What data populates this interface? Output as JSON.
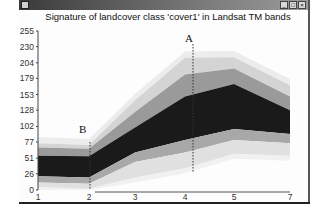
{
  "window": {
    "title_bar_buttons": [
      "minimize",
      "maximize",
      "close"
    ]
  },
  "chart_data": {
    "type": "area",
    "title": "Signature of landcover class 'cover1' in Landsat TM bands",
    "xlabel": "",
    "ylabel": "",
    "x": [
      1,
      2,
      3,
      4,
      5,
      7
    ],
    "x_tick_labels": [
      "1",
      "2",
      "3",
      "4",
      "5",
      "7"
    ],
    "y_tick_labels": [
      "0",
      "26",
      "51",
      "77",
      "102",
      "128",
      "153",
      "179",
      "204",
      "230",
      "255"
    ],
    "ylim": [
      0,
      255
    ],
    "grid": false,
    "legend": null,
    "series": [
      {
        "name": "outer upper (lightest)",
        "values": [
          75,
          72,
          144,
          212,
          213,
          168
        ]
      },
      {
        "name": "upper (light gray)",
        "values": [
          68,
          66,
          125,
          185,
          195,
          150
        ]
      },
      {
        "name": "core upper (black)",
        "values": [
          55,
          54,
          100,
          150,
          170,
          128
        ]
      },
      {
        "name": "core lower (black)",
        "values": [
          22,
          20,
          60,
          80,
          98,
          90
        ]
      },
      {
        "name": "lower (light gray)",
        "values": [
          12,
          10,
          45,
          60,
          80,
          75
        ]
      },
      {
        "name": "outer lower (lightest)",
        "values": [
          5,
          2,
          20,
          35,
          58,
          55
        ]
      }
    ],
    "annotations": [
      {
        "label": "A",
        "x": 4.1,
        "type": "dashed vertical line"
      },
      {
        "label": "B",
        "x": 2,
        "type": "dashed vertical line"
      }
    ]
  }
}
